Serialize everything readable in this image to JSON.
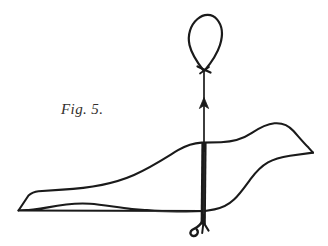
{
  "figure": {
    "caption": "Fig. 5.",
    "title": "Fig. 5.",
    "background_color": "#ffffff",
    "ink_color": "#1a1a1a",
    "caption_color": "#332f2d",
    "width": 328,
    "height": 246,
    "parts": [
      {
        "name": "hanging-loop",
        "label": "hanging loop",
        "description": "teardrop shaped wire loop at top",
        "top_y": 15,
        "bottom_y": 70,
        "left_x": 189,
        "right_x": 219
      },
      {
        "name": "loop-knot",
        "label": "knot",
        "description": "small Y shaped crossing where loop ends meet the shaft",
        "center_x": 204,
        "center_y": 70
      },
      {
        "name": "thin-shaft",
        "label": "thin shaft",
        "description": "thin vertical line from knot down to the bird's back",
        "top_y": 72,
        "bottom_y": 143
      },
      {
        "name": "up-arrowhead",
        "label": "upward arrow",
        "description": "small arrowhead pointing up on the thin shaft",
        "center_x": 204,
        "center_y": 103
      },
      {
        "name": "thick-skewer",
        "label": "thick skewer",
        "description": "heavy black vertical bar through the bird's body",
        "top_y": 143,
        "bottom_y": 224,
        "center_x": 204
      },
      {
        "name": "bottom-hook",
        "label": "hook",
        "description": "small barbed hook curling to the left at the bottom of the skewer",
        "center_x": 203,
        "center_y": 229
      },
      {
        "name": "bird-outline",
        "label": "bird outline",
        "description": "single continuous contour: wedge tail at left, curved back, head and pointed beak at right, wavy belly",
        "tail_tip_x": 18,
        "tail_tip_y": 210,
        "beak_tip_x": 313,
        "beak_tip_y": 153,
        "back_plateau_y": 143
      }
    ]
  }
}
